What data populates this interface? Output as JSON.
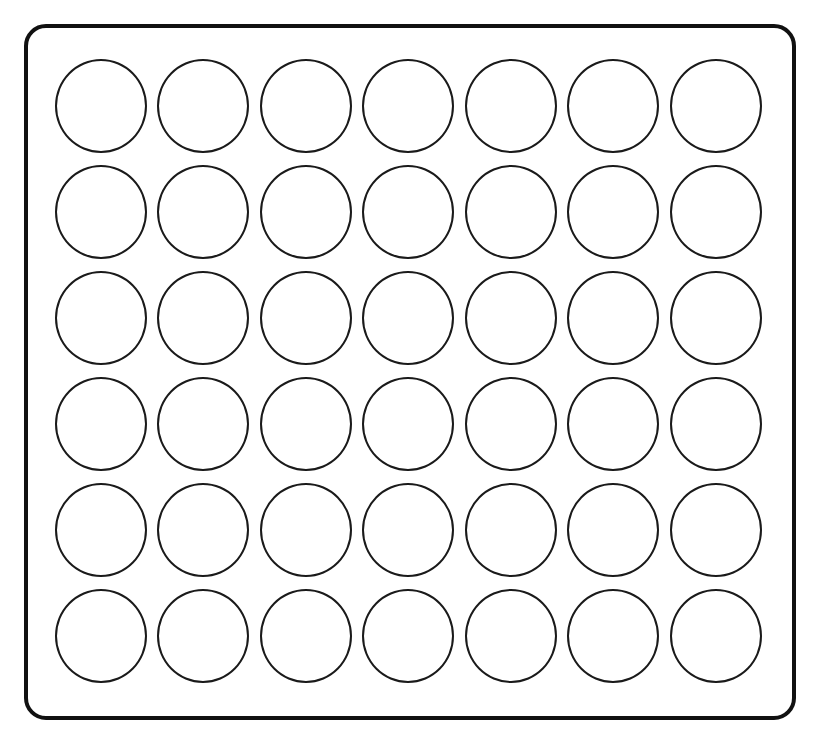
{
  "game": {
    "type": "connect-four-board",
    "rows": 6,
    "columns": 7,
    "colors": {
      "board_border": "#111111",
      "cell_border": "#1a1a1a",
      "cell_fill": "#ffffff",
      "background": "#ffffff"
    },
    "cells": [
      [
        "empty",
        "empty",
        "empty",
        "empty",
        "empty",
        "empty",
        "empty"
      ],
      [
        "empty",
        "empty",
        "empty",
        "empty",
        "empty",
        "empty",
        "empty"
      ],
      [
        "empty",
        "empty",
        "empty",
        "empty",
        "empty",
        "empty",
        "empty"
      ],
      [
        "empty",
        "empty",
        "empty",
        "empty",
        "empty",
        "empty",
        "empty"
      ],
      [
        "empty",
        "empty",
        "empty",
        "empty",
        "empty",
        "empty",
        "empty"
      ],
      [
        "empty",
        "empty",
        "empty",
        "empty",
        "empty",
        "empty",
        "empty"
      ]
    ]
  }
}
